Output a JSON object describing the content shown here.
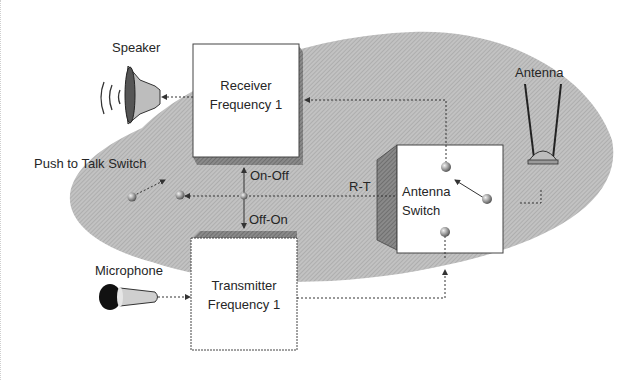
{
  "diagram": {
    "colors": {
      "background": "#ffffff",
      "ellipse_fill": "#b9b9b9",
      "box_fill": "#ffffff",
      "box_shadow": "#6f6f6f",
      "line": "#3a3a3a",
      "text": "#262626"
    },
    "labels": {
      "speaker": "Speaker",
      "antenna": "Antenna",
      "push_to_talk": "Push to Talk Switch",
      "microphone": "Microphone",
      "on_off": "On-Off",
      "off_on": "Off-On",
      "r_t": "R-T"
    },
    "blocks": {
      "receiver": {
        "line1": "Receiver",
        "line2": "Frequency 1"
      },
      "transmitter": {
        "line1": "Transmitter",
        "line2": "Frequency 1"
      },
      "antenna_switch": {
        "line1": "Antenna",
        "line2": "Switch"
      }
    },
    "connections": [
      {
        "from": "antenna-switch",
        "to": "receiver",
        "style": "dotted-arrow"
      },
      {
        "from": "receiver",
        "to": "speaker",
        "style": "dotted-arrow"
      },
      {
        "from": "microphone",
        "to": "transmitter",
        "style": "dotted-arrow"
      },
      {
        "from": "transmitter",
        "to": "antenna-switch",
        "style": "dotted-arrow"
      },
      {
        "from": "antenna",
        "to": "antenna-switch",
        "style": "dotted-line"
      },
      {
        "from": "antenna-switch",
        "to": "push-to-talk-switch",
        "label": "R-T",
        "style": "dotted-arrow"
      },
      {
        "from": "ptt-node",
        "to": "receiver",
        "label": "On-Off",
        "style": "dotted-arrow"
      },
      {
        "from": "ptt-node",
        "to": "transmitter",
        "label": "Off-On",
        "style": "dotted-arrow"
      }
    ],
    "icons": [
      "speaker-icon",
      "antenna-icon",
      "microphone-icon",
      "switch-contact-icon"
    ]
  }
}
